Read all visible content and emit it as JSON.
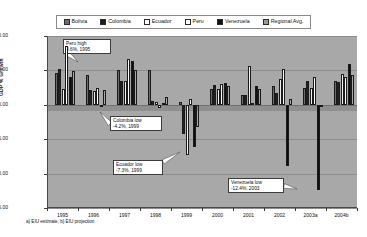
{
  "chart_data": {
    "type": "bar",
    "title": "",
    "xlabel": "",
    "ylabel": "GDP % Growth",
    "ylim": [
      -15,
      10
    ],
    "ytick_values": [
      10,
      5,
      0,
      -5,
      -10,
      -15
    ],
    "ytick_labels": [
      "10.00",
      "5.00",
      "0.00",
      "-5.00",
      "-10.00",
      "-15.00"
    ],
    "grid": true,
    "legend_position": "top",
    "categories": [
      "1995",
      "1996",
      "1997",
      "1998",
      "1999",
      "2000",
      "2001",
      "2002",
      "2003a",
      "2004b"
    ],
    "series": [
      {
        "name": "Bolivia",
        "color": "#6b6b6b",
        "values": [
          4.7,
          4.4,
          5.0,
          5.0,
          0.4,
          2.3,
          1.5,
          2.8,
          2.4,
          3.4
        ]
      },
      {
        "name": "Colombia",
        "color": "#232323",
        "values": [
          5.2,
          2.1,
          3.4,
          0.6,
          -4.2,
          2.9,
          1.4,
          1.7,
          3.4,
          3.3
        ]
      },
      {
        "name": "Ecuador",
        "color": "#f2f2f2",
        "values": [
          2.3,
          2.0,
          3.4,
          0.4,
          -7.3,
          2.3,
          5.6,
          3.8,
          2.5,
          4.5
        ]
      },
      {
        "name": "Peru",
        "color": "#fdfdfd",
        "values": [
          8.6,
          2.5,
          6.7,
          -0.5,
          0.9,
          3.0,
          0.2,
          5.2,
          4.0,
          4.1
        ]
      },
      {
        "name": "Venezuela",
        "color": "#0e0e0e",
        "values": [
          4.0,
          -0.2,
          6.4,
          0.2,
          -6.1,
          3.2,
          2.8,
          -8.9,
          -12.4,
          6.0
        ]
      },
      {
        "name": "Regional Avg.",
        "color": "#959595",
        "values": [
          4.9,
          2.2,
          5.0,
          1.1,
          -3.3,
          2.7,
          2.3,
          0.9,
          -0.2,
          4.3
        ]
      }
    ],
    "annotations": [
      {
        "id": "peru-high",
        "line1": "Peru high",
        "line2": "8.6%, 1995"
      },
      {
        "id": "colombia-low",
        "line1": "Colombia low",
        "line2": "-4.2%, 1999"
      },
      {
        "id": "ecuador-low",
        "line1": "Ecuador low",
        "line2": "-7.3%, 1999"
      },
      {
        "id": "venezuela-low",
        "line1": "Venezuela low",
        "line2": "-12.4%, 2003"
      }
    ],
    "footnote": "a) EIU estimate, b) EIU projection"
  },
  "legend": {
    "items": [
      {
        "label": "Bolivia",
        "swatch": "sw-bolivia"
      },
      {
        "label": "Colombia",
        "swatch": "sw-colombia"
      },
      {
        "label": "Ecuador",
        "swatch": "sw-ecuador"
      },
      {
        "label": "Peru",
        "swatch": "sw-peru"
      },
      {
        "label": "Venezuela",
        "swatch": "sw-venezuela"
      },
      {
        "label": "Regional Avg.",
        "swatch": "sw-regional"
      }
    ]
  }
}
